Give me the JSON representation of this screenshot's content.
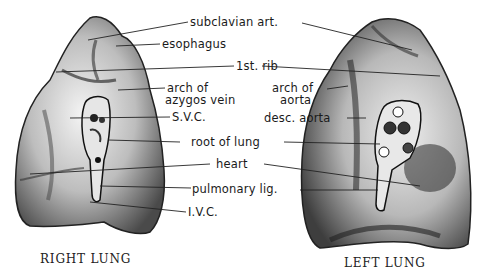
{
  "diagram": {
    "labels": {
      "subclavian": "subclavian art.",
      "esophagus": "esophagus",
      "rib": "1st. rib",
      "azygos_1": "arch of",
      "azygos_2": "azygos vein",
      "aorta_1": "arch of",
      "aorta_2": "aorta",
      "svc": "S.V.C.",
      "desc_aorta": "desc. aorta",
      "root": "root of lung",
      "heart": "heart",
      "pulm_lig": "pulmonary lig.",
      "ivc": "I.V.C."
    },
    "captions": {
      "right": "RIGHT LUNG",
      "left": "LEFT LUNG"
    }
  }
}
